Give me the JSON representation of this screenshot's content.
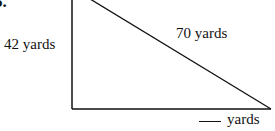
{
  "problem": {
    "number_fragment": "5."
  },
  "triangle": {
    "left_side_label": "42 yards",
    "hypotenuse_label": "70 yards",
    "bottom_side_label": "yards",
    "bottom_side_value": "",
    "stroke_color": "#111111"
  }
}
